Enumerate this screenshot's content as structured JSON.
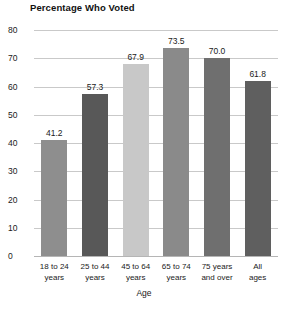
{
  "chart_data": {
    "type": "bar",
    "title": "Percentage Who Voted",
    "xlabel": "Age",
    "ylabel": "",
    "ylim": [
      0,
      80
    ],
    "yticks": [
      0,
      10,
      20,
      30,
      40,
      50,
      60,
      70,
      80
    ],
    "ytick_labels": [
      "0",
      "10",
      "20",
      "30",
      "40",
      "50",
      "60",
      "70",
      "80"
    ],
    "grid": true,
    "legend": "none",
    "categories": [
      "18 to 24 years",
      "25 to 44 years",
      "45 to 64 years",
      "65 to 74 years",
      "75 years and over",
      "All ages"
    ],
    "category_lines": [
      [
        "18 to 24",
        "years"
      ],
      [
        "25 to 44",
        "years"
      ],
      [
        "45 to 64",
        "years"
      ],
      [
        "65 to 74",
        "years"
      ],
      [
        "75 years",
        "and over"
      ],
      [
        "All",
        "ages"
      ]
    ],
    "values": [
      41.2,
      57.3,
      67.9,
      73.5,
      70.0,
      61.8
    ],
    "value_labels": [
      "41.2",
      "57.3",
      "67.9",
      "73.5",
      "70.0",
      "61.8"
    ],
    "bar_colors": [
      "#8e8e8e",
      "#585858",
      "#c8c8c8",
      "#8a8a8a",
      "#6f6f6f",
      "#5f5f5f"
    ],
    "grid_color": "#c9c9c9",
    "background": "#ffffff",
    "text_color": "#1a1a1a"
  }
}
